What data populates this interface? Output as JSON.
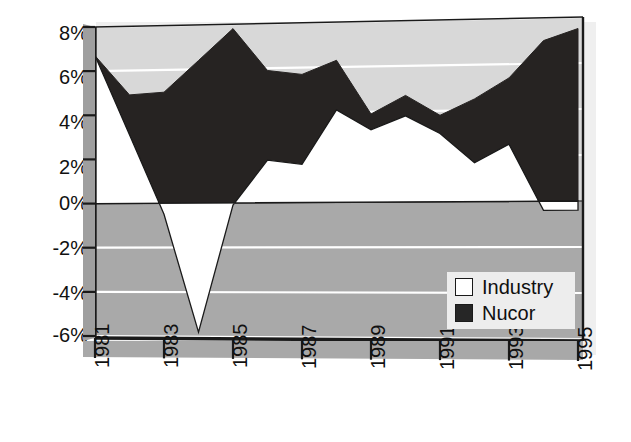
{
  "chart_data": {
    "type": "area",
    "title": "",
    "subtitle": "",
    "xlabel": "",
    "ylabel": "",
    "x": [
      1981,
      1982,
      1983,
      1984,
      1985,
      1986,
      1987,
      1988,
      1989,
      1990,
      1991,
      1992,
      1993,
      1994,
      1995
    ],
    "xtick_labels": [
      "1981",
      "1983",
      "1985",
      "1987",
      "1989",
      "1991",
      "1993",
      "1995"
    ],
    "xtick_values": [
      1981,
      1983,
      1985,
      1987,
      1989,
      1991,
      1993,
      1995
    ],
    "ytick_labels": [
      "8%",
      "6%",
      "4%",
      "2%",
      "0%",
      "-2%",
      "-4%",
      "-6%"
    ],
    "ytick_values": [
      8,
      6,
      4,
      2,
      0,
      -2,
      -4,
      -6
    ],
    "ylim": [
      -6,
      8
    ],
    "xlim": [
      1981,
      1995
    ],
    "grid": true,
    "grid_color": "#ffffff",
    "legend_position": "bottom-right",
    "series": [
      {
        "name": "Industry",
        "color": "#ffffff",
        "values": [
          6.7,
          3.1,
          -0.5,
          -5.8,
          -0.1,
          1.9,
          1.7,
          4.1,
          3.2,
          3.8,
          3.0,
          1.7,
          2.5,
          -0.4,
          -0.4
        ]
      },
      {
        "name": "Nucor",
        "color": "#231f20",
        "values": [
          6.7,
          4.9,
          5.0,
          6.4,
          7.8,
          5.9,
          5.7,
          6.3,
          3.9,
          4.7,
          3.8,
          4.5,
          5.4,
          7.0,
          7.5
        ]
      }
    ],
    "plot_bg_above_zero": "#d6d6d6",
    "plot_bg_below_zero": "#a8a8a8",
    "axis_color": "#1a1a1a"
  },
  "legend": {
    "items": [
      {
        "label": "Industry",
        "swatch": "#ffffff"
      },
      {
        "label": "Nucor",
        "swatch": "#262626"
      }
    ]
  }
}
